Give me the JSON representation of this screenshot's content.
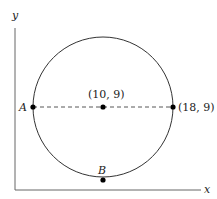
{
  "axes": {
    "x_label": "x",
    "y_label": "y"
  },
  "circle": {
    "center_label": "(10, 9)",
    "right_point_label": "(18, 9)",
    "left_point_label": "A",
    "bottom_point_label": "B"
  },
  "colors": {
    "stroke": "#333333",
    "axis": "#555555",
    "point": "#000000"
  }
}
